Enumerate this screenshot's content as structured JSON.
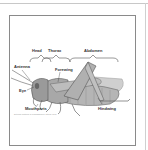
{
  "diagram": {
    "labels": {
      "head": "Head",
      "thorax": "Thorax",
      "abdomen": "Abdomen",
      "antenna": "Antenna",
      "forewing": "Forewing",
      "eye": "Eye",
      "mouthparts": "Mouthparts",
      "hindwing": "Hindwing"
    },
    "caption": "External features of a grasshopper (lateral view)",
    "colors": {
      "line": "#555555",
      "frame": "#8a8a8a",
      "body": "#9a9a9a"
    }
  }
}
